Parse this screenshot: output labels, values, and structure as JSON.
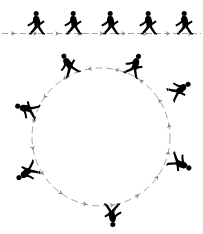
{
  "figure": {
    "background_color": "#ffffff",
    "figure_color": "#000000",
    "arrow_color": "#8c8c8c"
  },
  "paths": [
    {
      "id": "linear-path",
      "name": "straight-line-walk",
      "type": "line",
      "direction": "left-to-right",
      "baseline_y": 33,
      "start_x": 2,
      "end_x": 201,
      "walker_count": 5,
      "arrow_color": "#8c8c8c",
      "arrow_style": "dashed-with-arrowheads"
    },
    {
      "id": "circular-path",
      "name": "circular-walk",
      "type": "circle",
      "direction": "counter-clockwise",
      "center_x": 101,
      "center_y": 137,
      "radius": 69,
      "walker_count": 7,
      "arrow_color": "#8c8c8c",
      "arrow_style": "dashed-with-arrowheads"
    }
  ],
  "linear_walkers": [
    {
      "id": "lw1",
      "label": "walker-1",
      "x": 36,
      "y": 33,
      "rotation_deg": 0,
      "scale": 1.0
    },
    {
      "id": "lw2",
      "label": "walker-2",
      "x": 73,
      "y": 33,
      "rotation_deg": 0,
      "scale": 1.0
    },
    {
      "id": "lw3",
      "label": "walker-3",
      "x": 110,
      "y": 33,
      "rotation_deg": 0,
      "scale": 1.0
    },
    {
      "id": "lw4",
      "label": "walker-4",
      "x": 148,
      "y": 33,
      "rotation_deg": 0,
      "scale": 1.0
    },
    {
      "id": "lw5",
      "label": "walker-5",
      "x": 184,
      "y": 33,
      "rotation_deg": 0,
      "scale": 1.0
    }
  ],
  "circular_walkers": [
    {
      "id": "cw1",
      "label": "walker-c1",
      "angle_deg": 295,
      "x": 130,
      "y": 74,
      "rotation_deg": 25,
      "scale": 1.0
    },
    {
      "id": "cw2",
      "label": "walker-c2",
      "angle_deg": 245,
      "x": 72,
      "y": 74,
      "rotation_deg": -25,
      "scale": 1.0
    },
    {
      "id": "cw3",
      "label": "walker-c3",
      "angle_deg": 200,
      "x": 36,
      "y": 113,
      "rotation_deg": -70,
      "scale": 1.0
    },
    {
      "id": "cw4",
      "label": "walker-c4",
      "angle_deg": 155,
      "x": 36,
      "y": 168,
      "rotation_deg": -120,
      "scale": 1.0
    },
    {
      "id": "cw5",
      "label": "walker-c5",
      "angle_deg": 100,
      "x": 113,
      "y": 205,
      "rotation_deg": 180,
      "scale": 1.0
    },
    {
      "id": "cw6",
      "label": "walker-c6",
      "angle_deg": 35,
      "x": 172,
      "y": 158,
      "rotation_deg": 120,
      "scale": 1.0
    },
    {
      "id": "cw7",
      "label": "walker-c7",
      "angle_deg": 340,
      "x": 171,
      "y": 94,
      "rotation_deg": 60,
      "scale": 1.0
    }
  ],
  "arrow_markers": {
    "linear_arrowheads": 9,
    "circular_arrowheads": 16,
    "head_length": 4,
    "head_width": 3
  }
}
